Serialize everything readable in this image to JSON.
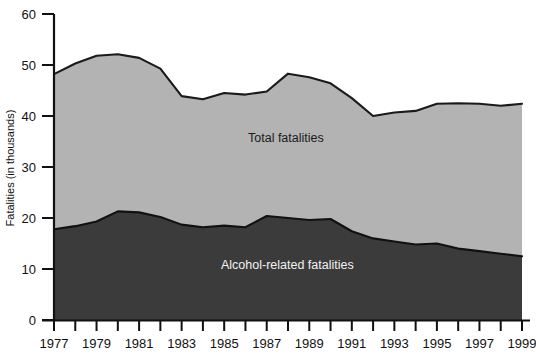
{
  "chart_data": {
    "type": "area",
    "stacked": false,
    "title": "",
    "subtitle": "",
    "xlabel": "",
    "ylabel": "Fatalities (in thousands)",
    "xlim": [
      1977,
      1999
    ],
    "ylim": [
      0,
      60
    ],
    "grid": false,
    "legend_position": "inline-annotation",
    "x": [
      1977,
      1978,
      1979,
      1980,
      1981,
      1982,
      1983,
      1984,
      1985,
      1986,
      1987,
      1988,
      1989,
      1990,
      1991,
      1992,
      1993,
      1994,
      1995,
      1996,
      1997,
      1998,
      1999
    ],
    "y_ticks": [
      0,
      10,
      20,
      30,
      40,
      50,
      60
    ],
    "x_tick_labels": [
      "1977",
      "",
      "1979",
      "",
      "1981",
      "",
      "1983",
      "",
      "1985",
      "",
      "1987",
      "",
      "1989",
      "",
      "1991",
      "",
      "1993",
      "",
      "1995",
      "",
      "1997",
      "",
      "1999"
    ],
    "x_tick_labels_shown": [
      "1977",
      "1979",
      "1981",
      "1983",
      "1985",
      "1987",
      "1989",
      "1991",
      "1993",
      "1995",
      "1997",
      "1999"
    ],
    "series": [
      {
        "name": "Total fatalities",
        "label": "Total fatalities",
        "fill_color": "#b3b3b3",
        "line_color": "#1a1a1a",
        "label_color": "#1b1b1b",
        "values": [
          48.2,
          50.3,
          51.8,
          52.1,
          51.4,
          49.3,
          43.9,
          43.3,
          44.5,
          44.2,
          44.8,
          48.3,
          47.6,
          46.4,
          43.5,
          40.0,
          40.7,
          41.0,
          42.4,
          42.5,
          42.4,
          42.0,
          42.4
        ]
      },
      {
        "name": "Alcohol-related fatalities",
        "label": "Alcohol-related fatalities",
        "fill_color": "#3b3b3b",
        "line_color": "#111111",
        "label_color": "#f2f2f2",
        "values": [
          17.8,
          18.4,
          19.3,
          21.3,
          21.1,
          20.2,
          18.7,
          18.2,
          18.5,
          18.2,
          20.4,
          20.0,
          19.6,
          19.8,
          17.4,
          16.0,
          15.4,
          14.8,
          15.0,
          14.0,
          13.5,
          13.0,
          12.5
        ]
      }
    ],
    "annotations": [
      {
        "text": "Total fatalities",
        "x": 1990,
        "y": 34.5,
        "color": "#1b1b1b"
      },
      {
        "text": "Alcohol-related fatalities",
        "x": 1989,
        "y": 10.4,
        "color": "#f2f2f2"
      }
    ]
  },
  "axes": {
    "y_axis_title": "Fatalities (in thousands)",
    "y_tick_values": [
      "60",
      "50",
      "40",
      "30",
      "20",
      "10",
      "0"
    ],
    "x_tick_values": [
      "1977",
      "1979",
      "1981",
      "1983",
      "1985",
      "1987",
      "1989",
      "1991",
      "1993",
      "1995",
      "1997",
      "1999"
    ]
  },
  "colors": {
    "total_fill": "#b3b3b3",
    "alcohol_fill": "#3b3b3b",
    "outline": "#1a1a1a",
    "axis": "#111111",
    "background": "#ffffff",
    "light_text": "#f2f2f2"
  }
}
